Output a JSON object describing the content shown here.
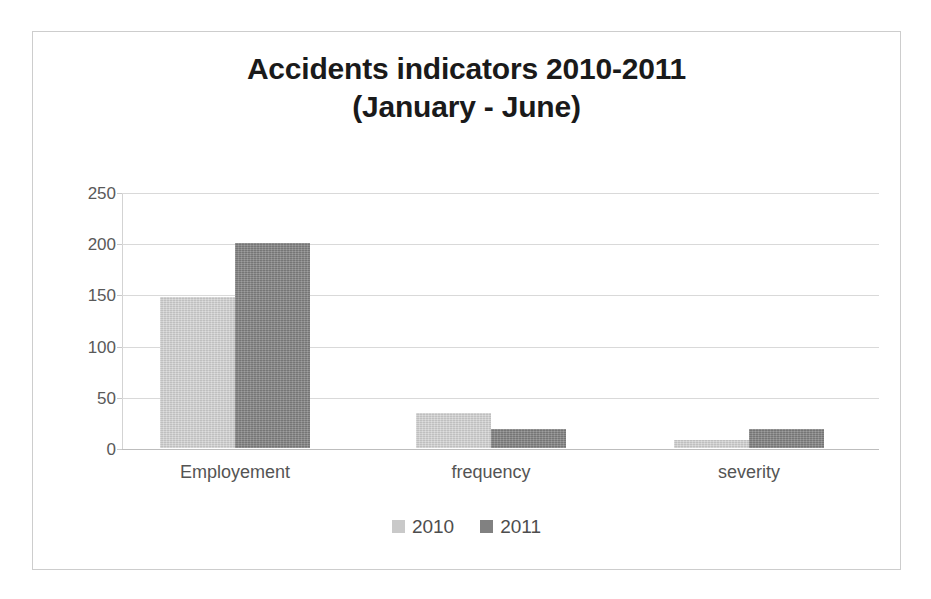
{
  "chart_data": {
    "type": "bar",
    "title": "Accidents indicators 2010-2011",
    "subtitle": "(January - June)",
    "title_lines": [
      "Accidents indicators 2010-2011",
      "(January - June)"
    ],
    "categories": [
      "Employement",
      "frequency",
      "severity"
    ],
    "series": [
      {
        "name": "2010",
        "color": "#c9c9c9",
        "values": [
          147,
          34,
          8
        ]
      },
      {
        "name": "2011",
        "color": "#818181",
        "values": [
          200,
          19,
          19
        ]
      }
    ],
    "xlabel": "",
    "ylabel": "",
    "ylim": [
      0,
      250
    ],
    "ytick_labels": [
      "250",
      "200",
      "150",
      "100",
      "50",
      "0"
    ],
    "ytick_values": [
      250,
      200,
      150,
      100,
      50,
      0
    ],
    "grid": true,
    "legend_position": "bottom",
    "legend_entries": [
      "2010",
      "2011"
    ]
  },
  "frame": {
    "border_color": "#cdcdcd",
    "background": "#ffffff"
  },
  "style": {
    "gridline_color": "#d9d9d9",
    "axis_color": "#bdbdbd",
    "tick_label_color": "#595959",
    "category_label_color": "#545454",
    "title_color": "#1a1a1a"
  }
}
